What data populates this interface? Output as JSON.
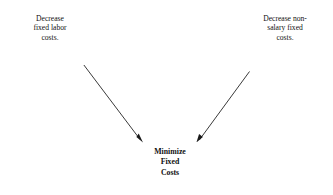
{
  "diagram": {
    "background": "#ffffff",
    "edge_color": "#3a3a3a",
    "border_color": "#3a3a3a",
    "text_color": "#111111",
    "nodes": {
      "left": {
        "name": "decrease-fixed-labor-costs",
        "lines": [
          "Decrease",
          "fixed labor",
          "costs."
        ],
        "text": "Decrease fixed labor costs."
      },
      "right": {
        "name": "decrease-non-salary-fixed-costs",
        "lines": [
          "Decrease non-",
          "salary fixed",
          "costs."
        ],
        "text": "Decrease non-salary fixed costs."
      },
      "bottom": {
        "name": "minimize-fixed-costs",
        "lines": [
          "Minimize",
          "Fixed",
          "Costs"
        ],
        "text": "Minimize Fixed Costs"
      }
    },
    "edges": [
      {
        "name": "edge-left-to-bottom",
        "from": "left",
        "to": "bottom",
        "arrowhead": "solid-triangle",
        "direction": "down-right"
      },
      {
        "name": "edge-right-to-bottom",
        "from": "right",
        "to": "bottom",
        "arrowhead": "solid-triangle",
        "direction": "down-left"
      }
    ]
  }
}
